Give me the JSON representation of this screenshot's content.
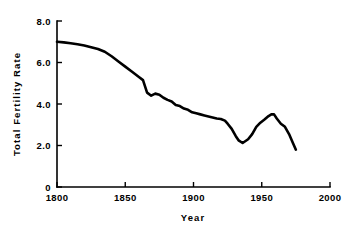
{
  "chart_data": {
    "type": "line",
    "title": "",
    "xlabel": "Year",
    "ylabel": "Total Fertility Rate",
    "xlim": [
      1800,
      2000
    ],
    "ylim": [
      0,
      8.0
    ],
    "grid": false,
    "legend": false,
    "x_ticks": [
      "1800",
      "1850",
      "1900",
      "1950",
      "2000"
    ],
    "x_tick_values": [
      1800,
      1850,
      1900,
      1950,
      2000
    ],
    "y_ticks": [
      "0",
      "2.0",
      "4.0",
      "6.0",
      "8.0"
    ],
    "y_tick_values": [
      0,
      2.0,
      4.0,
      6.0,
      8.0
    ],
    "line_color": "#000000",
    "series": [
      {
        "name": "Total Fertility Rate",
        "x": [
          1800,
          1805,
          1810,
          1815,
          1820,
          1825,
          1830,
          1835,
          1840,
          1845,
          1850,
          1855,
          1860,
          1863,
          1866,
          1869,
          1872,
          1875,
          1878,
          1881,
          1884,
          1887,
          1890,
          1893,
          1896,
          1899,
          1902,
          1905,
          1908,
          1911,
          1914,
          1917,
          1920,
          1923,
          1925,
          1928,
          1931,
          1933,
          1936,
          1940,
          1943,
          1946,
          1949,
          1952,
          1955,
          1957,
          1959,
          1961,
          1964,
          1967,
          1970,
          1973,
          1975
        ],
        "y": [
          7.0,
          6.97,
          6.93,
          6.88,
          6.82,
          6.74,
          6.65,
          6.52,
          6.3,
          6.05,
          5.8,
          5.55,
          5.3,
          5.15,
          4.55,
          4.4,
          4.5,
          4.45,
          4.3,
          4.2,
          4.12,
          3.95,
          3.9,
          3.78,
          3.72,
          3.6,
          3.55,
          3.5,
          3.45,
          3.4,
          3.35,
          3.3,
          3.28,
          3.2,
          3.05,
          2.8,
          2.45,
          2.25,
          2.12,
          2.3,
          2.55,
          2.9,
          3.1,
          3.25,
          3.42,
          3.5,
          3.5,
          3.3,
          3.05,
          2.9,
          2.55,
          2.1,
          1.8
        ]
      }
    ]
  },
  "axis": {
    "x_title": "Year",
    "y_title": "Total Fertility Rate"
  }
}
